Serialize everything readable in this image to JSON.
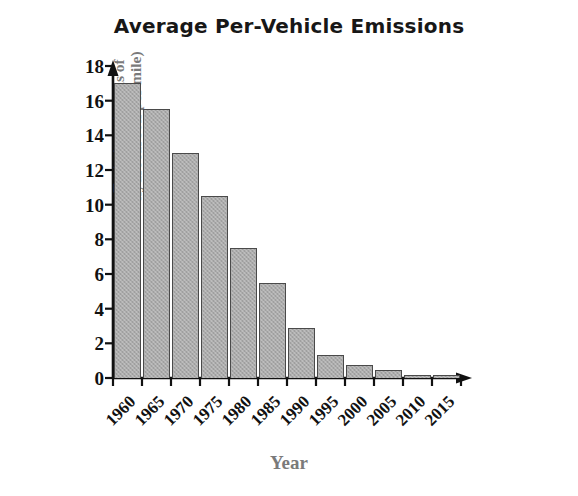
{
  "chart_data": {
    "type": "bar",
    "title": "Average Per-Vehicle Emissions",
    "xlabel": "Year",
    "ylabel": "Emissions (grams of hydrocarbon per mile)",
    "ylabel_line1": "Emissions (grams of",
    "ylabel_line2": "hydrocarbon per mile)",
    "categories": [
      "1960",
      "1965",
      "1970",
      "1975",
      "1980",
      "1985",
      "1990",
      "1995",
      "2000",
      "2005",
      "2010",
      "2015"
    ],
    "values": [
      17,
      15.5,
      13,
      10.5,
      7.5,
      5.5,
      2.9,
      1.35,
      0.75,
      0.45,
      0.2,
      0.2
    ],
    "yticks": [
      0,
      2,
      4,
      6,
      8,
      10,
      12,
      14,
      16,
      18
    ],
    "ytick_labels": [
      "0",
      "2",
      "4",
      "6",
      "8",
      "10",
      "12",
      "14",
      "16",
      "18"
    ],
    "ylim": [
      0,
      18
    ],
    "grid": false,
    "legend": "none",
    "bar_color": "#ababab",
    "bar_edge_color": "#4a4a4a",
    "axis_color": "#111111",
    "label_color": "#7a7a7a",
    "title_color": "#171717"
  }
}
